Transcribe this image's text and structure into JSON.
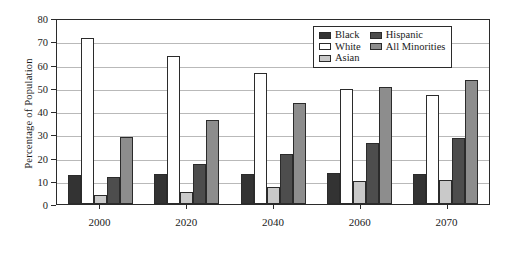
{
  "chart_data": {
    "type": "bar",
    "title": "",
    "subtitle": "",
    "xlabel": "",
    "ylabel": "Percentage of Population",
    "categories": [
      "2000",
      "2020",
      "2040",
      "2060",
      "2070"
    ],
    "ylim": [
      0,
      80
    ],
    "yticks": [
      0,
      10,
      20,
      30,
      40,
      50,
      60,
      70,
      80
    ],
    "grid": true,
    "legend_position": "upper right",
    "series": [
      {
        "name": "Black",
        "color": "#333333",
        "values": [
          12.3,
          12.7,
          12.9,
          13.2,
          13.0
        ]
      },
      {
        "name": "White",
        "color": "#ffffff",
        "values": [
          71.5,
          63.7,
          56.2,
          49.5,
          46.8
        ]
      },
      {
        "name": "Asian",
        "color": "#c9c9c9",
        "values": [
          4.0,
          5.2,
          7.4,
          9.8,
          10.5
        ]
      },
      {
        "name": "Hispanic",
        "color": "#4d4d4d",
        "values": [
          11.8,
          17.2,
          21.7,
          26.3,
          28.4
        ]
      },
      {
        "name": "All Minorities",
        "color": "#8d8d8d",
        "values": [
          28.7,
          36.0,
          43.6,
          50.2,
          53.2
        ]
      }
    ]
  },
  "legend": {
    "entries": [
      {
        "label": "Black",
        "key": "black"
      },
      {
        "label": "Hispanic",
        "key": "hispanic"
      },
      {
        "label": "White",
        "key": "white"
      },
      {
        "label": "All Minorities",
        "key": "allmin"
      },
      {
        "label": "Asian",
        "key": "asian"
      }
    ]
  }
}
